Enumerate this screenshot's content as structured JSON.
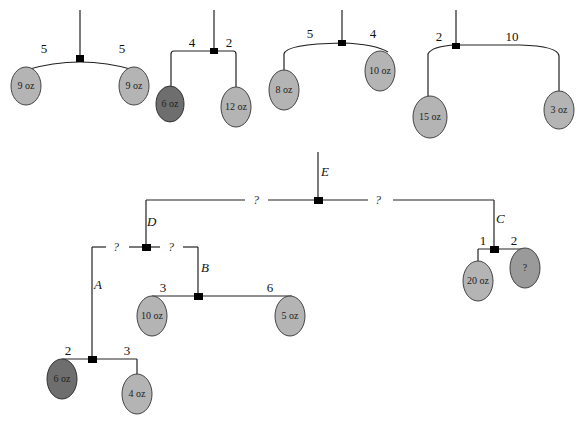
{
  "mobiles_top": [
    {
      "id": "m1",
      "left_arm": "5",
      "right_arm": "5",
      "left_weight": "9 oz",
      "right_weight": "9 oz",
      "left_shade": "light",
      "right_shade": "light"
    },
    {
      "id": "m2",
      "left_arm": "4",
      "right_arm": "2",
      "left_weight": "6 oz",
      "right_weight": "12 oz",
      "left_shade": "dark",
      "right_shade": "light"
    },
    {
      "id": "m3",
      "left_arm": "5",
      "right_arm": "4",
      "left_weight": "8 oz",
      "right_weight": "10 oz",
      "left_shade": "light",
      "right_shade": "light"
    },
    {
      "id": "m4",
      "left_arm": "2",
      "right_arm": "10",
      "left_weight": "15 oz",
      "right_weight": "3 oz",
      "left_shade": "light",
      "right_shade": "light"
    }
  ],
  "compound_mobile": {
    "labels": {
      "E": "E",
      "D": "D",
      "C": "C",
      "B": "B",
      "A": "A"
    },
    "top_bar": {
      "left_arm": "?",
      "right_arm": "?"
    },
    "d_bar": {
      "left_arm": "?",
      "right_arm": "?"
    },
    "c_bar": {
      "left_arm": "1",
      "right_arm": "2",
      "left_weight": "20 oz",
      "right_weight": "?"
    },
    "b_bar": {
      "left_arm": "3",
      "right_arm": "6",
      "left_weight": "10 oz",
      "right_weight": "5 oz"
    },
    "a_bar": {
      "left_arm": "2",
      "right_arm": "3",
      "left_weight": "6 oz",
      "right_weight": "4 oz"
    }
  },
  "colors": {
    "light_weight": "#b4b4b4",
    "dark_weight": "#6e6e6e",
    "line": "#222222",
    "pivot": "#000000"
  }
}
